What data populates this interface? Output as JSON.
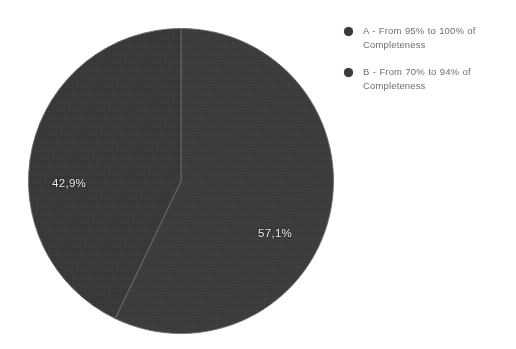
{
  "background_color": "#ffffff",
  "chart_data": {
    "type": "pie",
    "title": "",
    "subtitle": "",
    "xlabel": "",
    "ylabel": "",
    "grid": false,
    "legend_position": "right",
    "start_angle_deg": 0,
    "direction": "clockwise",
    "categories": [
      "A - From 95% to 100% of Completeness",
      "B - From 70% to 94% of Completeness"
    ],
    "values": [
      57.1,
      42.9
    ],
    "value_labels": [
      "57,1%",
      "42,9%"
    ],
    "slice_colors": [
      "#3c3c3c",
      "#383838"
    ],
    "slices": [
      {
        "key": "A",
        "label": "A - From 95% to 100% of Completeness",
        "value": 57.1,
        "value_label": "57,1%",
        "color": "#3c3c3c",
        "start_angle_deg": 0,
        "end_angle_deg": 205.6
      },
      {
        "key": "B",
        "label": "B - From 70% to 94% of Completeness",
        "value": 42.9,
        "value_label": "42,9%",
        "color": "#383838",
        "start_angle_deg": 205.6,
        "end_angle_deg": 360
      }
    ]
  },
  "pie": {
    "label_a": "57,1%",
    "label_b": "42,9%"
  },
  "legend": {
    "marker_color": "#3a3a3a",
    "items": [
      {
        "marker": "legend-marker-a",
        "label": "A - From 95% to 100% of Completeness"
      },
      {
        "marker": "legend-marker-b",
        "label": "B - From 70% to 94% of Completeness"
      }
    ]
  }
}
